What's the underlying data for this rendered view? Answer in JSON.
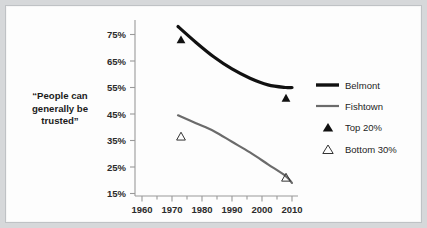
{
  "chart_data": {
    "type": "line",
    "title": "“People can generally be trusted”",
    "xlabel": "",
    "ylabel": "“People can generally be trusted”",
    "xlim": [
      1958,
      2012
    ],
    "ylim": [
      15,
      78
    ],
    "grid": false,
    "legend_position": "right",
    "xticks": [
      1960,
      1970,
      1980,
      1990,
      2000,
      2010
    ],
    "xticklabels": [
      "1960",
      "1970",
      "1980",
      "1990",
      "2000",
      "2010"
    ],
    "yticks": [
      15,
      25,
      35,
      45,
      55,
      65,
      75
    ],
    "yticklabels": [
      "15%",
      "25%",
      "35%",
      "45%",
      "55%",
      "65%",
      "75%"
    ],
    "series": [
      {
        "name": "Belmont",
        "style": "line",
        "color": "#111111",
        "width": 3.2,
        "x": [
          1972,
          1978,
          1984,
          1990,
          1996,
          2002,
          2008,
          2010
        ],
        "values": [
          78,
          72,
          66.5,
          62,
          58.5,
          56,
          55,
          55
        ]
      },
      {
        "name": "Fishtown",
        "style": "line",
        "color": "#6b6b6b",
        "width": 2.2,
        "x": [
          1972,
          1978,
          1984,
          1990,
          1996,
          2002,
          2008,
          2010
        ],
        "values": [
          44.5,
          41.5,
          38.5,
          34.5,
          30.5,
          26,
          21.5,
          19
        ]
      },
      {
        "name": "Top 20%",
        "style": "marker-filled-triangle",
        "color": "#111111",
        "x": [
          1973,
          2008
        ],
        "values": [
          73,
          51
        ]
      },
      {
        "name": "Bottom 30%",
        "style": "marker-open-triangle",
        "color": "#333333",
        "x": [
          1973,
          2008
        ],
        "values": [
          36.5,
          21
        ]
      }
    ],
    "legend": [
      {
        "label": "Belmont",
        "marker": "thick-line",
        "color": "#111111"
      },
      {
        "label": "Fishtown",
        "marker": "thin-line",
        "color": "#6b6b6b"
      },
      {
        "label": "Top 20%",
        "marker": "filled-triangle",
        "color": "#111111"
      },
      {
        "label": "Bottom 30%",
        "marker": "open-triangle",
        "color": "#333333"
      }
    ]
  },
  "axis": {
    "y_title_lines": [
      "“People can",
      "generally be",
      "trusted”"
    ],
    "y_labels": [
      "75%",
      "65%",
      "55%",
      "45%",
      "35%",
      "25%",
      "15%"
    ],
    "x_labels": [
      "1960",
      "1970",
      "1980",
      "1990",
      "2000",
      "2010"
    ]
  },
  "legend": {
    "items": [
      "Belmont",
      "Fishtown",
      "Top 20%",
      "Bottom 30%"
    ]
  },
  "colors": {
    "belmont": "#111111",
    "fishtown": "#6b6b6b",
    "axis": "#9a9a9a",
    "text": "#1b1b1b",
    "frame": "#d6d8da",
    "canvas": "#fdfdfd"
  }
}
